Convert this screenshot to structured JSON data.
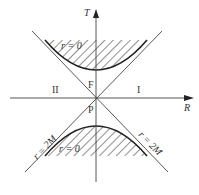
{
  "diagram": {
    "type": "Kruskal-Szekeres spacetime diagram",
    "axes": {
      "vertical_label": "T",
      "horizontal_label": "R"
    },
    "regions": {
      "right": "I",
      "left": "II",
      "future": "F",
      "past": "P"
    },
    "curves": {
      "upper_singularity": "r = 0",
      "lower_singularity": "r = 0",
      "left_horizon": "r = 2M",
      "right_horizon": "r = 2M"
    },
    "colors": {
      "line": "#333333",
      "background": "#ffffff"
    }
  }
}
